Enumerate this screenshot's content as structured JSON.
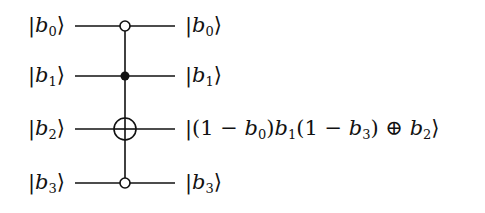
{
  "diagram": {
    "type": "quantum-circuit",
    "gate": "multi-controlled NOT (Toffoli-like)",
    "wires": [
      {
        "index": 0,
        "input_label": "b",
        "input_sub": "0",
        "output_label": "b",
        "output_sub": "0",
        "control": "open"
      },
      {
        "index": 1,
        "input_label": "b",
        "input_sub": "1",
        "output_label": "b",
        "output_sub": "1",
        "control": "filled"
      },
      {
        "index": 2,
        "input_label": "b",
        "input_sub": "2",
        "output_expr": "|(1 − b₀)b₁(1 − b₃) ⊕ b₂⟩",
        "control": "target"
      },
      {
        "index": 3,
        "input_label": "b",
        "input_sub": "3",
        "output_label": "b",
        "output_sub": "3",
        "control": "open"
      }
    ],
    "ket_open": "|",
    "ket_close": "⟩",
    "target_expr_parts": {
      "p1": "(1 − ",
      "p2": "b",
      "p3": "0",
      "p4": ")",
      "p5": "b",
      "p6": "1",
      "p7": "(1 − ",
      "p8": "b",
      "p9": "3",
      "p10": ") ⊕ ",
      "p11": "b",
      "p12": "2"
    },
    "colors": {
      "line": "#111111",
      "background": "#ffffff"
    }
  }
}
